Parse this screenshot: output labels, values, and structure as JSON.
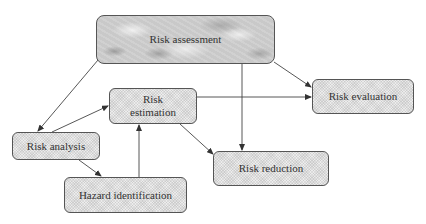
{
  "diagram": {
    "nodes": {
      "risk_assessment": {
        "label": "Risk assessment"
      },
      "risk_estimation": {
        "label": "Risk\nestimation",
        "line1": "Risk",
        "line2": "estimation"
      },
      "risk_evaluation": {
        "label": "Risk evaluation"
      },
      "risk_analysis": {
        "label": "Risk analysis"
      },
      "hazard_identification": {
        "label": "Hazard identification"
      },
      "risk_reduction": {
        "label": "Risk reduction"
      }
    },
    "edges": [
      {
        "from": "Risk assessment",
        "to": "Risk analysis"
      },
      {
        "from": "Risk assessment",
        "to": "Risk evaluation"
      },
      {
        "from": "Risk assessment",
        "to": "Risk reduction"
      },
      {
        "from": "Risk analysis",
        "to": "Risk estimation"
      },
      {
        "from": "Risk analysis",
        "to": "Hazard identification"
      },
      {
        "from": "Hazard identification",
        "to": "Risk estimation"
      },
      {
        "from": "Risk estimation",
        "to": "Risk evaluation"
      },
      {
        "from": "Risk estimation",
        "to": "Risk reduction"
      }
    ],
    "colors": {
      "line": "#444444",
      "box_border": "#555555",
      "text": "#333333"
    }
  }
}
